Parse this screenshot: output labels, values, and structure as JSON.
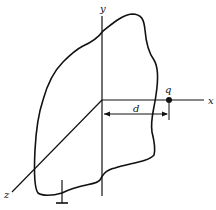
{
  "diagram": {
    "axes": {
      "x_label": "x",
      "y_label": "y",
      "z_label": "z"
    },
    "charge": {
      "label": "q"
    },
    "distance": {
      "label": "d"
    },
    "colors": {
      "line": "#111111",
      "background": "#ffffff"
    }
  }
}
